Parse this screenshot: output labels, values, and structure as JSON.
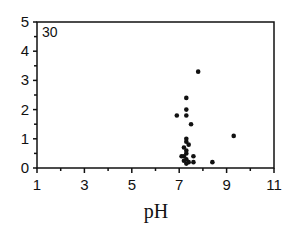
{
  "chart_data": {
    "type": "scatter",
    "title": "",
    "panel_label": "30",
    "xlabel": "pH",
    "ylabel": "",
    "xlim": [
      1,
      11
    ],
    "ylim": [
      0,
      5
    ],
    "x_ticks": [
      1,
      3,
      5,
      7,
      9,
      11
    ],
    "x_minor_ticks": [
      2,
      4,
      6,
      8,
      10
    ],
    "y_ticks": [
      0,
      1,
      2,
      3,
      4,
      5
    ],
    "y_minor_ticks": [
      0.5,
      1.5,
      2.5,
      3.5,
      4.5
    ],
    "grid": false,
    "legend": null,
    "marker_color": "#111111",
    "points": [
      {
        "x": 7.8,
        "y": 3.3
      },
      {
        "x": 7.3,
        "y": 2.4
      },
      {
        "x": 7.3,
        "y": 2.0
      },
      {
        "x": 6.9,
        "y": 1.8
      },
      {
        "x": 7.3,
        "y": 1.8
      },
      {
        "x": 7.5,
        "y": 1.5
      },
      {
        "x": 9.3,
        "y": 1.1
      },
      {
        "x": 7.3,
        "y": 1.0
      },
      {
        "x": 7.3,
        "y": 0.9
      },
      {
        "x": 7.4,
        "y": 0.8
      },
      {
        "x": 7.2,
        "y": 0.7
      },
      {
        "x": 7.3,
        "y": 0.6
      },
      {
        "x": 7.3,
        "y": 0.5
      },
      {
        "x": 7.1,
        "y": 0.4
      },
      {
        "x": 7.2,
        "y": 0.4
      },
      {
        "x": 7.6,
        "y": 0.4
      },
      {
        "x": 7.3,
        "y": 0.3
      },
      {
        "x": 7.2,
        "y": 0.25
      },
      {
        "x": 7.4,
        "y": 0.2
      },
      {
        "x": 7.6,
        "y": 0.2
      },
      {
        "x": 8.4,
        "y": 0.2
      },
      {
        "x": 7.3,
        "y": 0.15
      }
    ]
  }
}
